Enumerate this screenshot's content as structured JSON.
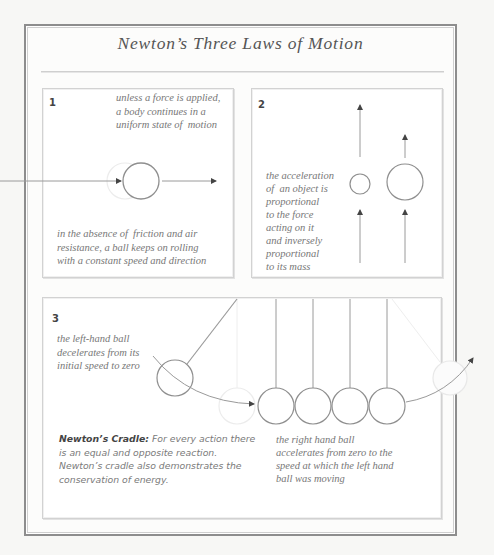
{
  "title": "Newton’s Three Laws of Motion",
  "colors": {
    "frame": "#8d8d8d",
    "panel_border": "#d2d2d2",
    "line": "#9a9a9a",
    "ghost": "#e6e6e6",
    "text": "#777777",
    "heading_text": "#444444",
    "background": "#f7f7f5"
  },
  "law1": {
    "number": "1",
    "caption_top": "unless a force is applied,\na body continues in a\nuniform state of  motion",
    "caption_bottom": "in the absence of  friction and air\nresistance, a ball keeps on rolling\nwith a constant speed and direction",
    "icons": [
      "ball-icon",
      "ghost-ball-icon",
      "arrow-right-icon"
    ]
  },
  "law2": {
    "number": "2",
    "caption": "the acceleration\nof  an object is\nproportional\nto the force\nacting on it\nand inversely\nproportional\nto its mass",
    "icons": [
      "small-ball-icon",
      "large-ball-icon",
      "arrow-up-icon"
    ]
  },
  "law3": {
    "number": "3",
    "caption_left": "the left-hand ball\ndecelerates from its\ninitial speed to zero",
    "caption_right": "the right hand ball\naccelerates from zero to the\nspeed at which the left hand\nball was moving",
    "cradle_label": "Newton’s Cradle:",
    "cradle_text": " For every action there\nis an equal and opposite reaction.\nNewton’s cradle also demonstrates the\nconservation of energy.",
    "ball_count": 4,
    "icons": [
      "pendulum-ball-icon",
      "ghost-ball-icon",
      "curved-arrow-icon"
    ]
  }
}
